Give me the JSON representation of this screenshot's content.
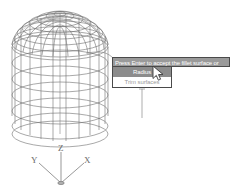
{
  "app": {
    "background_color": "#ffffff",
    "wireframe_color": "#6e6e6e"
  },
  "viewport": {
    "model_name": "filleted-cylinder-wireframe",
    "description": "3D wireframe cylinder with filleted rounded top cap"
  },
  "axis_indicator": {
    "name": "ucs-axis-tripod",
    "x_label": "X",
    "y_label": "Y",
    "z_label": "Z"
  },
  "context_menu": {
    "header": {
      "label": "Press Enter to accept the fillet surface or",
      "background_color": "#9a9a9a",
      "text_color": "#ffffff"
    },
    "items": [
      {
        "label": "Radius",
        "selected": true,
        "dim": false
      },
      {
        "label": "Trim surfaces",
        "selected": false,
        "dim": true
      }
    ],
    "highlight_color": "#8c8c8c"
  },
  "cursor": {
    "name": "arrow-pointer",
    "x": 152,
    "y": 65
  },
  "leaders": {
    "upper_leader": "curve from model edge to menu header left",
    "lower_leader": "vertical line from menu bottom downward"
  }
}
